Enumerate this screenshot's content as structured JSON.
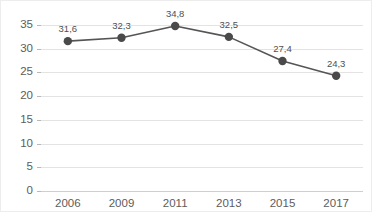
{
  "chart_data": {
    "type": "line",
    "title": "",
    "subtitle": "",
    "xlabel": "",
    "ylabel": "",
    "categories": [
      "2006",
      "2009",
      "2011",
      "2013",
      "2015",
      "2017"
    ],
    "values": [
      31.6,
      32.3,
      34.8,
      32.5,
      27.4,
      24.3
    ],
    "point_labels": [
      "31,6",
      "32,3",
      "34,8",
      "32,5",
      "27,4",
      "24,3"
    ],
    "decimal_separator": ",",
    "ylim": [
      0,
      35
    ],
    "ytick_values": [
      0,
      5,
      10,
      15,
      20,
      25,
      30,
      35
    ],
    "ytick_labels": [
      "0",
      "5",
      "10",
      "15",
      "20",
      "25",
      "30",
      "35"
    ],
    "grid": true,
    "grid_axis": "y",
    "legend": false,
    "legend_position": "none",
    "series": [
      {
        "name": "",
        "values": [
          31.6,
          32.3,
          34.8,
          32.5,
          27.4,
          24.3
        ],
        "marker": "circle",
        "show_labels": true
      }
    ],
    "colors": {
      "line": "#555555",
      "marker": "#4a4a4a",
      "grid": "#e3e3e3",
      "axis": "#b8b8b8",
      "text": "#5c5c5c",
      "label_text": "#4f4f4f",
      "background": "#ffffff",
      "border": "#ededed"
    }
  }
}
